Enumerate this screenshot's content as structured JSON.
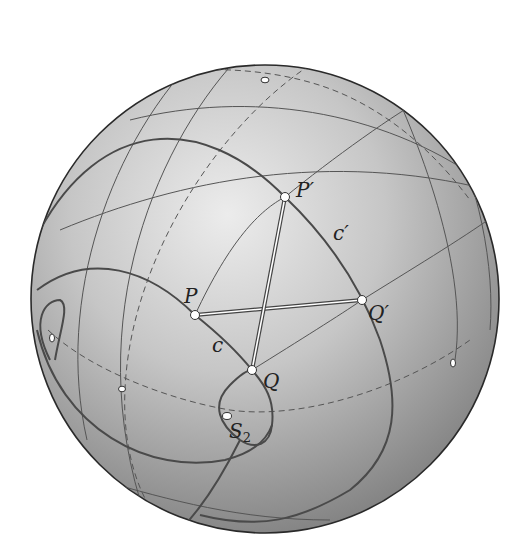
{
  "figure": {
    "colors": {
      "background": "#ffffff",
      "sphere_light": "#e6e6e6",
      "sphere_dark": "#7d7d7d",
      "outline": "#2a2a2a",
      "line": "#555555",
      "thick_line": "#4a4a4a"
    },
    "labels": {
      "P": "P",
      "P_prime": "P′",
      "Q": "Q",
      "Q_prime": "Q′",
      "c": "c",
      "c_prime": "c′",
      "S2": "S",
      "S2_sub": "2"
    }
  }
}
